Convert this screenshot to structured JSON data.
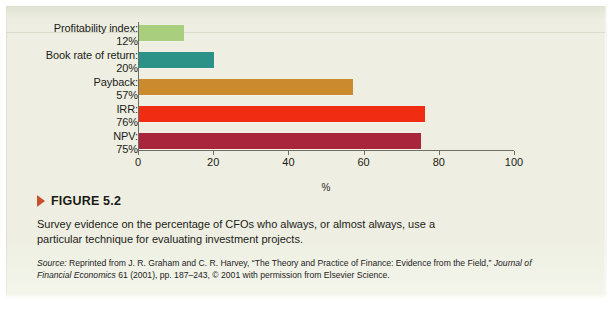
{
  "figure": {
    "marker_icon": "triangle-right-icon",
    "title": "FIGURE 5.2",
    "caption": "Survey evidence on the percentage of CFOs who always, or almost always, use a particular technique for evaluating investment projects.",
    "source_lead": "Source:",
    "source_text_1": " Reprinted from J. R. Graham and C. R. Harvey, “The Theory and Practice of Finance: Evidence from the Field,” ",
    "source_journal": "Journal of Financial Economics",
    "source_text_2": " 61 (2001), pp. 187–243, © 2001 with permission from Elsevier Science."
  },
  "chart_data": {
    "type": "bar",
    "orientation": "horizontal",
    "title": "",
    "xlabel": "%",
    "ylabel": "",
    "xlim": [
      0,
      100
    ],
    "xticks": [
      "0",
      "20",
      "40",
      "60",
      "80",
      "100"
    ],
    "xtick_values": [
      0,
      20,
      40,
      60,
      80,
      100
    ],
    "grid": false,
    "legend": "none",
    "categories": [
      "Profitability index:",
      "Book rate of return:",
      "Payback:",
      "IRR:",
      "NPV:"
    ],
    "values": [
      12,
      20,
      57,
      76,
      75
    ],
    "value_labels": [
      "12%",
      "20%",
      "57%",
      "76%",
      "75%"
    ],
    "colors": [
      "#a8ce7e",
      "#2c9187",
      "#cc8a2e",
      "#f02d13",
      "#a8253c"
    ],
    "bars": [
      {
        "category": "Profitability index:",
        "value": 12,
        "value_label": "12%",
        "color": "#a8ce7e"
      },
      {
        "category": "Book rate of return:",
        "value": 20,
        "value_label": "20%",
        "color": "#2c9187"
      },
      {
        "category": "Payback:",
        "value": 57,
        "value_label": "57%",
        "color": "#cc8a2e"
      },
      {
        "category": "IRR:",
        "value": 76,
        "value_label": "76%",
        "color": "#f02d13"
      },
      {
        "category": "NPV:",
        "value": 75,
        "value_label": "75%",
        "color": "#a8253c"
      }
    ]
  },
  "colors": {
    "paper": "#eeefe2",
    "axis": "#6d6f63",
    "text": "#1c1c18",
    "marker_accent": "#c8502a"
  }
}
